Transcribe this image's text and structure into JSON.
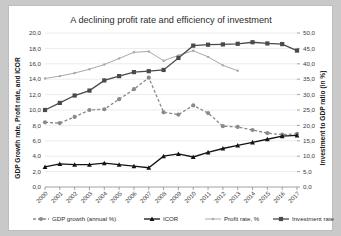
{
  "chart_data": {
    "type": "line",
    "title": "A declining profit rate and efficiency of investment",
    "xlabel": "",
    "ylabel": "GDP Growth rate, Profit rate, and ICOR",
    "y2label": "Investment to GDP ratio (in %)",
    "categories": [
      "2000",
      "2001",
      "2002",
      "2003",
      "2004",
      "2005",
      "2006",
      "2007",
      "2008",
      "2009",
      "2010",
      "2011",
      "2012",
      "2013",
      "2014",
      "2015",
      "2016",
      "2017"
    ],
    "ylim": [
      0,
      20
    ],
    "yticks": [
      "0,0",
      "2,0",
      "4,0",
      "6,0",
      "8,0",
      "10,0",
      "12,0",
      "14,0",
      "16,0",
      "18,0",
      "20,0"
    ],
    "y2lim": [
      0,
      50
    ],
    "y2ticks": [
      "0,0",
      "5,0",
      "10,0",
      "15,0",
      "20,0",
      "25,0",
      "30,0",
      "35,0",
      "40,0",
      "45,0",
      "50,0"
    ],
    "grid": true,
    "legend_position": "bottom",
    "series": [
      {
        "name": "GDP growth (annual %)",
        "axis": "left",
        "color": "#8a8a8a",
        "marker": "circle",
        "dash": "3,2",
        "values": [
          8.4,
          8.3,
          9.1,
          10.0,
          10.1,
          11.4,
          12.7,
          14.2,
          9.7,
          9.4,
          10.6,
          9.6,
          7.9,
          7.8,
          7.4,
          7.0,
          6.8,
          6.9
        ]
      },
      {
        "name": "ICOR",
        "axis": "left",
        "color": "#141414",
        "marker": "triangle",
        "dash": "none",
        "values": [
          2.6,
          3.0,
          2.9,
          2.9,
          3.1,
          2.9,
          2.7,
          2.5,
          4.0,
          4.3,
          3.9,
          4.5,
          5.0,
          5.4,
          5.8,
          6.2,
          6.6,
          6.7
        ]
      },
      {
        "name": "Profit rate, %",
        "axis": "left",
        "color": "#a8a8a8",
        "marker": "dot",
        "dash": "none",
        "values": [
          14.1,
          14.4,
          14.8,
          15.3,
          15.9,
          16.7,
          17.5,
          17.6,
          16.4,
          17.1,
          17.7,
          16.9,
          15.8,
          15.1,
          null,
          null,
          null,
          null
        ]
      },
      {
        "name": "Investment rate, %",
        "axis": "right",
        "color": "#4a4a4a",
        "marker": "square",
        "dash": "none",
        "values": [
          25.0,
          27.3,
          29.7,
          31.3,
          34.6,
          36.0,
          37.3,
          37.6,
          38.0,
          41.9,
          45.9,
          46.2,
          46.3,
          46.5,
          47.0,
          46.6,
          46.4,
          44.3
        ]
      }
    ]
  }
}
